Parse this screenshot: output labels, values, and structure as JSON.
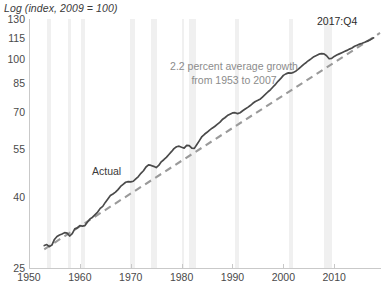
{
  "chart_data": {
    "type": "line",
    "title": "Log (index, 2009 = 100)",
    "xlabel": "",
    "ylabel": "Log (index, 2009 = 100)",
    "yscale": "log",
    "ylim": [
      25,
      130
    ],
    "xlim": [
      1950,
      2019
    ],
    "grid": false,
    "legend": "none",
    "y_ticks": [
      130,
      115,
      100,
      85,
      70,
      55,
      40,
      25
    ],
    "x_ticks": [
      1950,
      1960,
      1970,
      1980,
      1990,
      2000,
      2010
    ],
    "annotations": [
      {
        "name": "trend-annotation",
        "text_line1": "2.2 percent average growth",
        "text_line2": "from 1953 to 2007",
        "color": "#8c8c8c"
      },
      {
        "name": "endpoint-annotation",
        "text": "2017:Q4",
        "color": "#2b2b2b"
      },
      {
        "name": "actual-series-label",
        "text": "Actual",
        "color": "#3a3a3a"
      }
    ],
    "series": [
      {
        "name": "Actual",
        "style": "solid",
        "color": "#4a4a4a",
        "x": [
          1953.0,
          1953.5,
          1954.0,
          1954.5,
          1955.0,
          1955.5,
          1956.0,
          1956.5,
          1957.0,
          1957.5,
          1958.0,
          1958.5,
          1959.0,
          1959.5,
          1960.0,
          1960.5,
          1961.0,
          1961.5,
          1962.0,
          1962.5,
          1963.0,
          1963.5,
          1964.0,
          1964.5,
          1965.0,
          1965.5,
          1966.0,
          1966.5,
          1967.0,
          1967.5,
          1968.0,
          1968.5,
          1969.0,
          1969.5,
          1970.0,
          1970.5,
          1971.0,
          1971.5,
          1972.0,
          1972.5,
          1973.0,
          1973.5,
          1974.0,
          1974.5,
          1975.0,
          1975.5,
          1976.0,
          1976.5,
          1977.0,
          1977.5,
          1978.0,
          1978.5,
          1979.0,
          1979.5,
          1980.0,
          1980.5,
          1981.0,
          1981.5,
          1982.0,
          1982.5,
          1983.0,
          1983.5,
          1984.0,
          1984.5,
          1985.0,
          1985.5,
          1986.0,
          1986.5,
          1987.0,
          1987.5,
          1988.0,
          1988.5,
          1989.0,
          1989.5,
          1990.0,
          1990.5,
          1991.0,
          1991.5,
          1992.0,
          1992.5,
          1993.0,
          1993.5,
          1994.0,
          1994.5,
          1995.0,
          1995.5,
          1996.0,
          1996.5,
          1997.0,
          1997.5,
          1998.0,
          1998.5,
          1999.0,
          1999.5,
          2000.0,
          2000.5,
          2001.0,
          2001.5,
          2002.0,
          2002.5,
          2003.0,
          2003.5,
          2004.0,
          2004.5,
          2005.0,
          2005.5,
          2006.0,
          2006.5,
          2007.0,
          2007.5,
          2008.0,
          2008.5,
          2009.0,
          2009.5,
          2010.0,
          2010.5,
          2011.0,
          2011.5,
          2012.0,
          2012.5,
          2013.0,
          2013.5,
          2014.0,
          2014.5,
          2015.0,
          2015.5,
          2016.0,
          2016.5,
          2017.0,
          2017.5,
          2017.75
        ],
        "y": [
          29.0,
          29.2,
          28.8,
          29.1,
          30.2,
          30.8,
          31.1,
          31.3,
          31.6,
          31.5,
          30.9,
          31.4,
          32.4,
          32.6,
          33.1,
          33.0,
          33.1,
          33.9,
          34.6,
          35.0,
          35.6,
          36.2,
          37.1,
          37.6,
          38.6,
          39.5,
          40.4,
          40.8,
          41.3,
          42.0,
          42.9,
          43.5,
          44.1,
          44.3,
          44.2,
          44.4,
          45.1,
          45.8,
          46.8,
          47.6,
          48.8,
          49.5,
          49.3,
          49.0,
          48.6,
          49.3,
          50.5,
          51.2,
          52.0,
          53.0,
          54.0,
          55.1,
          55.8,
          56.0,
          55.6,
          55.3,
          56.3,
          56.2,
          55.3,
          55.2,
          56.6,
          58.1,
          59.7,
          60.6,
          61.4,
          62.3,
          63.1,
          63.8,
          64.7,
          65.6,
          66.8,
          67.6,
          68.6,
          69.2,
          69.8,
          69.9,
          69.5,
          69.9,
          70.8,
          71.6,
          72.4,
          73.3,
          74.4,
          75.3,
          75.9,
          76.6,
          77.8,
          79.0,
          80.3,
          81.5,
          83.0,
          84.5,
          86.2,
          87.7,
          89.5,
          90.4,
          91.0,
          90.8,
          91.3,
          92.2,
          93.4,
          94.8,
          96.3,
          97.5,
          98.8,
          100.0,
          101.3,
          102.1,
          103.0,
          103.4,
          103.2,
          101.9,
          99.9,
          100.2,
          101.5,
          102.4,
          103.2,
          104.0,
          104.8,
          105.6,
          106.5,
          107.3,
          108.5,
          109.3,
          110.1,
          110.7,
          111.4,
          112.3,
          113.2,
          114.3,
          114.8
        ]
      },
      {
        "name": "2.2 percent trend (1953-2007)",
        "style": "dashed",
        "color": "#9a9a9a",
        "growth_rate_percent": 2.2,
        "start_year": 1953,
        "end_year": 2007,
        "x": [
          1953.0,
          2019.0
        ],
        "y": [
          28.3,
          118.5
        ]
      }
    ],
    "recession_bands": [
      {
        "start": 1953.5,
        "end": 1954.4
      },
      {
        "start": 1957.6,
        "end": 1958.3
      },
      {
        "start": 1960.3,
        "end": 1961.1
      },
      {
        "start": 1969.9,
        "end": 1970.9
      },
      {
        "start": 1973.9,
        "end": 1975.2
      },
      {
        "start": 1980.0,
        "end": 1980.5
      },
      {
        "start": 1981.5,
        "end": 1982.9
      },
      {
        "start": 1990.5,
        "end": 1991.2
      },
      {
        "start": 2001.2,
        "end": 2001.9
      },
      {
        "start": 2007.9,
        "end": 2009.5
      }
    ],
    "colors": {
      "actual_line": "#4a4a4a",
      "trend_line": "#9a9a9a",
      "recession_band": "#f0f0f0",
      "axis": "#c9c9c9",
      "tick_text": "#4a4a4a",
      "annotation_text": "#8c8c8c"
    }
  }
}
